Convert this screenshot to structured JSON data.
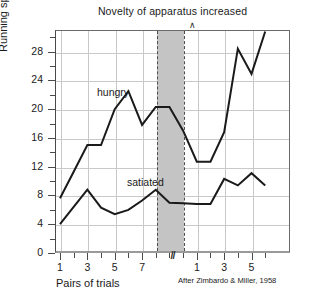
{
  "chart_data": {
    "type": "line",
    "title": "Novelty of apparatus increased",
    "xlabel": "Pairs of trials",
    "ylabel": "Running speed (100/sec.)",
    "credit": "After Zimbardo & Miller, 1958",
    "grid": true,
    "legend_position": "inline-annotations",
    "ylim": [
      0,
      31
    ],
    "yticks": [
      0,
      4,
      8,
      12,
      16,
      20,
      24,
      28
    ],
    "yticklabels": [
      "0",
      "4",
      "8",
      "12",
      "16",
      "20",
      "24",
      "28"
    ],
    "yminorticks": [
      2,
      6,
      10,
      14,
      18,
      22,
      26,
      30
    ],
    "x_phases": [
      {
        "name": "pre-novelty",
        "ticklabels": [
          "1",
          "3",
          "5",
          "7"
        ],
        "tickvalues": [
          1,
          3,
          5,
          7
        ]
      },
      {
        "name": "post-novelty",
        "ticklabels": [
          "1",
          "3",
          "5"
        ],
        "tickvalues": [
          1,
          3,
          5
        ]
      }
    ],
    "axis_break": "//",
    "shaded_region": {
      "label": "Novelty of apparatus increased",
      "color": "#c4c4c4",
      "edge_style": "dashed",
      "start_index": 8,
      "end_index": 10
    },
    "series": [
      {
        "name": "hungry",
        "color": "#1a1a1a",
        "x": [
          1,
          2,
          3,
          4,
          5,
          6,
          7,
          8,
          9,
          10,
          11,
          12,
          13,
          14,
          15,
          16
        ],
        "values": [
          7.6,
          11.3,
          15.0,
          15.0,
          20.0,
          22.5,
          17.8,
          20.3,
          20.3,
          17.0,
          12.7,
          12.7,
          16.8,
          28.4,
          24.9,
          30.8
        ]
      },
      {
        "name": "satiated",
        "color": "#1a1a1a",
        "x": [
          1,
          2,
          3,
          4,
          5,
          6,
          7,
          8,
          9,
          10,
          11,
          12,
          13,
          14,
          15,
          16
        ],
        "values": [
          4.0,
          6.4,
          8.8,
          6.3,
          5.4,
          6.0,
          7.3,
          8.8,
          7.0,
          6.9,
          6.8,
          6.8,
          10.3,
          9.4,
          11.1,
          9.4
        ]
      }
    ],
    "annotations": [
      {
        "text": "hungry",
        "x_px": 97,
        "y_px": 86
      },
      {
        "text": "satiated",
        "x_px": 127,
        "y_px": 176
      }
    ]
  }
}
